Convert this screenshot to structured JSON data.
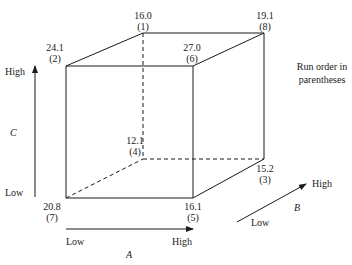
{
  "figure": {
    "type": "cube-plot",
    "note": "Run order in parentheses",
    "note_lines": [
      "Run order in",
      "parentheses"
    ]
  },
  "axes": {
    "A": {
      "name": "A",
      "low_label": "Low",
      "high_label": "High"
    },
    "B": {
      "name": "B",
      "low_label": "Low",
      "high_label": "High"
    },
    "C": {
      "name": "C",
      "low_label": "Low",
      "high_label": "High"
    }
  },
  "vertices": [
    {
      "id": "v1",
      "value": "16.0",
      "run": "(1)",
      "A": "Low",
      "B": "High",
      "C": "High"
    },
    {
      "id": "v2",
      "value": "24.1",
      "run": "(2)",
      "A": "Low",
      "B": "Low",
      "C": "High"
    },
    {
      "id": "v3",
      "value": "15.2",
      "run": "(3)",
      "A": "High",
      "B": "High",
      "C": "Low"
    },
    {
      "id": "v4",
      "value": "12.1",
      "run": "(4)",
      "A": "Low",
      "B": "High",
      "C": "Low"
    },
    {
      "id": "v5",
      "value": "16.1",
      "run": "(5)",
      "A": "High",
      "B": "Low",
      "C": "Low"
    },
    {
      "id": "v6",
      "value": "27.0",
      "run": "(6)",
      "A": "High",
      "B": "Low",
      "C": "High"
    },
    {
      "id": "v7",
      "value": "20.8",
      "run": "(7)",
      "A": "Low",
      "B": "Low",
      "C": "Low"
    },
    {
      "id": "v8",
      "value": "19.1",
      "run": "(8)",
      "A": "High",
      "B": "High",
      "C": "High"
    }
  ],
  "colors": {
    "line": "#1a1a1a",
    "background": "#ffffff"
  }
}
